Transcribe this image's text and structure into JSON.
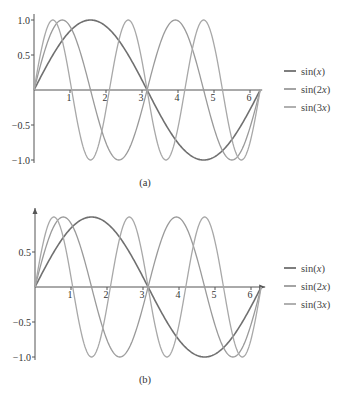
{
  "chart_data": [
    {
      "type": "line",
      "panel": "a",
      "caption": "(a)",
      "title": "",
      "xlabel": "",
      "ylabel": "",
      "xlim": [
        0,
        6.2832
      ],
      "ylim": [
        -1.0,
        1.0
      ],
      "x_ticks": [
        "1",
        "2",
        "3",
        "4",
        "5",
        "6"
      ],
      "y_ticks": [
        "1.0",
        "0.5",
        "-0.5",
        "-1.0"
      ],
      "axis_arrows": false,
      "grid": false,
      "legend_position": "right",
      "series": [
        {
          "name": "sin(x)",
          "func": "sin",
          "k": 1,
          "color": "#707070",
          "width": 1.6
        },
        {
          "name": "sin(2x)",
          "func": "sin",
          "k": 2,
          "color": "#9a9a9a",
          "width": 1.3
        },
        {
          "name": "sin(3x)",
          "func": "sin",
          "k": 3,
          "color": "#a8a8a8",
          "width": 1.3
        }
      ],
      "x": [
        0,
        0.5236,
        1.0472,
        1.5708,
        2.0944,
        2.618,
        3.1416,
        3.6652,
        4.1888,
        4.7124,
        5.236,
        5.7596,
        6.2832
      ],
      "values": {
        "sin(x)": [
          0,
          0.5,
          0.866,
          1.0,
          0.866,
          0.5,
          0,
          -0.5,
          -0.866,
          -1.0,
          -0.866,
          -0.5,
          0
        ],
        "sin(2x)": [
          0,
          0.866,
          0.866,
          0,
          -0.866,
          -0.866,
          0,
          0.866,
          0.866,
          0,
          -0.866,
          -0.866,
          0
        ],
        "sin(3x)": [
          0,
          1.0,
          0,
          -1.0,
          0,
          1.0,
          0,
          -1.0,
          0,
          1.0,
          0,
          -1.0,
          0
        ]
      }
    },
    {
      "type": "line",
      "panel": "b",
      "caption": "(b)",
      "title": "",
      "xlabel": "",
      "ylabel": "",
      "xlim": [
        0,
        6.2832
      ],
      "ylim": [
        -1.0,
        1.0
      ],
      "x_ticks": [
        "1",
        "2",
        "3",
        "4",
        "5",
        "6"
      ],
      "y_ticks": [
        "0.5",
        "-0.5",
        "-1.0"
      ],
      "axis_arrows": true,
      "grid": false,
      "legend_position": "right",
      "series": [
        {
          "name": "sin(x)",
          "func": "sin",
          "k": 1,
          "color": "#707070",
          "width": 1.6
        },
        {
          "name": "sin(2x)",
          "func": "sin",
          "k": 2,
          "color": "#9a9a9a",
          "width": 1.3
        },
        {
          "name": "sin(3x)",
          "func": "sin",
          "k": 3,
          "color": "#a8a8a8",
          "width": 1.3
        }
      ],
      "x": [
        0,
        0.5236,
        1.0472,
        1.5708,
        2.0944,
        2.618,
        3.1416,
        3.6652,
        4.1888,
        4.7124,
        5.236,
        5.7596,
        6.2832
      ],
      "values": {
        "sin(x)": [
          0,
          0.5,
          0.866,
          1.0,
          0.866,
          0.5,
          0,
          -0.5,
          -0.866,
          -1.0,
          -0.866,
          -0.5,
          0
        ],
        "sin(2x)": [
          0,
          0.866,
          0.866,
          0,
          -0.866,
          -0.866,
          0,
          0.866,
          0.866,
          0,
          -0.866,
          -0.866,
          0
        ],
        "sin(3x)": [
          0,
          1.0,
          0,
          -1.0,
          0,
          1.0,
          0,
          -1.0,
          0,
          1.0,
          0,
          -1.0,
          0
        ]
      }
    }
  ],
  "legend": {
    "items": [
      "sin(x)",
      "sin(2x)",
      "sin(3x)"
    ]
  },
  "colors": {
    "axis": "#555555",
    "sin_x": "#707070",
    "sin_2x": "#9a9a9a",
    "sin_3x": "#a8a8a8"
  }
}
